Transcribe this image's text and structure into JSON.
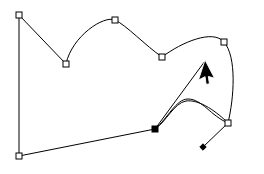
{
  "app": {
    "surface_name": "vector-path-editing-canvas",
    "background_color": "#ffffff",
    "width": 264,
    "height": 174
  },
  "style": {
    "path_stroke_color": "#000000",
    "path_stroke_width": 1,
    "path_fill": "none",
    "anchor_stroke_color": "#000000",
    "anchor_fill_color": "#ffffff",
    "anchor_selected_fill_color": "#000000",
    "handle_line_color": "#000000",
    "handle_dot_color": "#000000",
    "cursor_fill_color": "#000000",
    "cursor_outline_color": "#ffffff"
  },
  "geometry": {
    "closed_path": {
      "name": "main-outline-path",
      "d": "M 19 15 L 66 64 C 72 36 104 15 115 20 C 126 25 146 46 162 57 C 182 42 213 29 224 42 C 237 57 234 98 228 123 C 218 113 200 99 186 101 C 174 103 166 122 155 129 L 19 156 Z"
    },
    "left_edge_segment": {
      "name": "left-vertical-edge",
      "d": "M 19 15 L 19 156"
    },
    "inner_curve": {
      "name": "inner-s-curve",
      "d": "M 155 129 C 168 118 176 99 188 99 C 202 99 211 116 228 123"
    },
    "handle_line": {
      "name": "control-handle-line",
      "d": "M 228 123 L 203 147"
    },
    "drag_line": {
      "name": "drag-guide-line",
      "d": "M 155 129 L 205 61"
    },
    "anchors": [
      {
        "name": "anchor-top-left",
        "x": 19,
        "y": 15,
        "selected": false
      },
      {
        "name": "anchor-valley",
        "x": 66,
        "y": 64,
        "selected": false
      },
      {
        "name": "anchor-arch-top",
        "x": 115,
        "y": 20,
        "selected": false
      },
      {
        "name": "anchor-mid-dip",
        "x": 162,
        "y": 57,
        "selected": false
      },
      {
        "name": "anchor-upper-right",
        "x": 224,
        "y": 42,
        "selected": false
      },
      {
        "name": "anchor-lower-right",
        "x": 228,
        "y": 123,
        "selected": false
      },
      {
        "name": "anchor-bottom-left",
        "x": 19,
        "y": 156,
        "selected": false
      },
      {
        "name": "anchor-selected-node",
        "x": 155,
        "y": 129,
        "selected": true
      }
    ],
    "handle_point": {
      "name": "control-handle-point",
      "x": 203,
      "y": 147
    },
    "cursor": {
      "name": "mouse-pointer-cursor",
      "x": 205,
      "y": 60,
      "rotation_deg": 18
    }
  },
  "labels": {
    "canvas_title": "Vector path editing canvas",
    "cursor_label": "Mouse pointer",
    "selected_anchor_label": "Selected anchor point",
    "anchor_label": "Anchor point",
    "handle_label": "Bezier control handle"
  }
}
